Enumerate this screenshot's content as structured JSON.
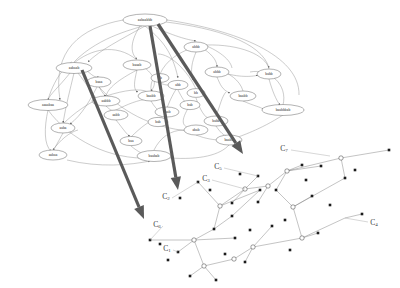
{
  "figure": {
    "background_color": "#ffffff",
    "width": 400,
    "height": 288
  },
  "colors": {
    "edge": "#8d8d8d",
    "edge_dark": "#6a6a6a",
    "node_outline": "#555555",
    "node_fill": "#ffffff",
    "label_text": "#202020",
    "cluster_text": "#3a3a3a",
    "thick_arrow": "#5a5a5a",
    "right_edge": "#7b7b7b",
    "right_node": "#1c1c1c"
  },
  "left_graph": {
    "name": "string-label-graph",
    "nodes": [
      {
        "id": "n1",
        "label": "aabaabbb",
        "cx": 145,
        "cy": 20,
        "rx": 22,
        "ry": 6
      },
      {
        "id": "n2",
        "label": "aabaab",
        "cx": 74,
        "cy": 68,
        "rx": 18,
        "ry": 5.5
      },
      {
        "id": "n3",
        "label": "baaab",
        "cx": 137,
        "cy": 65,
        "rx": 14,
        "ry": 5
      },
      {
        "id": "n4",
        "label": "abbb",
        "cx": 196,
        "cy": 47,
        "rx": 12,
        "ry": 5
      },
      {
        "id": "n5",
        "label": "abbb",
        "cx": 217,
        "cy": 72,
        "rx": 12,
        "ry": 5
      },
      {
        "id": "n6",
        "label": "babb",
        "cx": 269,
        "cy": 74,
        "rx": 12,
        "ry": 5
      },
      {
        "id": "n7",
        "label": "baabb",
        "cx": 243,
        "cy": 96,
        "rx": 13,
        "ry": 5
      },
      {
        "id": "n8",
        "label": "baabbbab",
        "cx": 283,
        "cy": 110,
        "rx": 21,
        "ry": 5.5
      },
      {
        "id": "n9",
        "label": "baaa",
        "cx": 99,
        "cy": 82,
        "rx": 12,
        "ry": 5
      },
      {
        "id": "n10",
        "label": "aaaabaa",
        "cx": 48,
        "cy": 105,
        "rx": 20,
        "ry": 5.5
      },
      {
        "id": "n11",
        "label": "aabbb",
        "cx": 106,
        "cy": 101,
        "rx": 14,
        "ry": 5
      },
      {
        "id": "n12",
        "label": "aabb",
        "cx": 116,
        "cy": 115,
        "rx": 12,
        "ry": 5
      },
      {
        "id": "n13",
        "label": "aaba",
        "cx": 63,
        "cy": 128,
        "rx": 12,
        "ry": 5
      },
      {
        "id": "n14",
        "label": "aabaa",
        "cx": 53,
        "cy": 155,
        "rx": 14,
        "ry": 5
      },
      {
        "id": "n15",
        "label": "baa",
        "cx": 131,
        "cy": 141,
        "rx": 11,
        "ry": 4.6
      },
      {
        "id": "n16",
        "label": "baab",
        "cx": 167,
        "cy": 112,
        "rx": 12,
        "ry": 5
      },
      {
        "id": "n17",
        "label": "baabb",
        "cx": 151,
        "cy": 96,
        "rx": 13,
        "ry": 5
      },
      {
        "id": "n18",
        "label": "bab",
        "cx": 158,
        "cy": 122,
        "rx": 10,
        "ry": 4.6
      },
      {
        "id": "n19",
        "label": "baabab",
        "cx": 154,
        "cy": 156,
        "rx": 17,
        "ry": 5.5
      },
      {
        "id": "n20",
        "label": "baabb",
        "cx": 229,
        "cy": 140,
        "rx": 13,
        "ry": 5
      },
      {
        "id": "n21",
        "label": "babb",
        "cx": 216,
        "cy": 121,
        "rx": 12,
        "ry": 5
      },
      {
        "id": "n22",
        "label": "bab",
        "cx": 190,
        "cy": 105,
        "rx": 10,
        "ry": 4.6
      },
      {
        "id": "n23",
        "label": "abb",
        "cx": 178,
        "cy": 85,
        "rx": 10,
        "ry": 4.6
      },
      {
        "id": "n24",
        "label": "ab",
        "cx": 160,
        "cy": 78,
        "rx": 9,
        "ry": 4.4
      },
      {
        "id": "n25",
        "label": "bb",
        "cx": 196,
        "cy": 93,
        "rx": 9,
        "ry": 4.4
      },
      {
        "id": "n26",
        "label": "abab",
        "cx": 196,
        "cy": 130,
        "rx": 12,
        "ry": 5
      }
    ]
  },
  "cluster_arrows": [
    {
      "name": "arrow-to-cluster-left",
      "x1": 82,
      "y1": 70,
      "x2": 144,
      "y2": 219
    },
    {
      "name": "arrow-to-cluster-middle",
      "x1": 150,
      "y1": 26,
      "x2": 178,
      "y2": 190
    },
    {
      "name": "arrow-to-cluster-right",
      "x1": 158,
      "y1": 24,
      "x2": 243,
      "y2": 154
    }
  ],
  "right_graph": {
    "name": "cluster-network",
    "cluster_labels": [
      {
        "id": "c7",
        "text": "C",
        "sub": "7",
        "x": 284,
        "y": 148
      },
      {
        "id": "c5",
        "text": "C",
        "sub": "5",
        "x": 218,
        "y": 166
      },
      {
        "id": "c3",
        "text": "C",
        "sub": "3",
        "x": 206,
        "y": 178
      },
      {
        "id": "c2",
        "text": "C",
        "sub": "2",
        "x": 166,
        "y": 196
      },
      {
        "id": "c6",
        "text": "C",
        "sub": "6",
        "x": 157,
        "y": 224
      },
      {
        "id": "c1",
        "text": "C",
        "sub": "1",
        "x": 167,
        "y": 248
      },
      {
        "id": "c4",
        "text": "C",
        "sub": "4",
        "x": 374,
        "y": 222
      }
    ],
    "hub_nodes": [
      {
        "x": 287,
        "y": 171
      },
      {
        "x": 341,
        "y": 158
      },
      {
        "x": 268,
        "y": 186
      },
      {
        "x": 245,
        "y": 189
      },
      {
        "x": 220,
        "y": 206
      },
      {
        "x": 293,
        "y": 207
      },
      {
        "x": 302,
        "y": 238
      },
      {
        "x": 253,
        "y": 247
      },
      {
        "x": 234,
        "y": 259
      },
      {
        "x": 194,
        "y": 240
      },
      {
        "x": 204,
        "y": 266
      }
    ]
  }
}
